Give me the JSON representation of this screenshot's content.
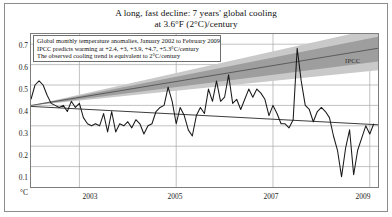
{
  "figure": {
    "title_line_1": "A long, fast decline: 7 years' global cooling",
    "title_line_2": "at 3.6°F (2°C)/century"
  },
  "legend": {
    "line_1": "Global monthly temperature anomalies, January 2002 to February 2009",
    "line_2": "IPCC predicts warming at +2.4, +3, +3.9, +4.7, +5.3°C/century",
    "line_3": "The observed cooling trend is equivalent to 2°C/century"
  },
  "annotations": {
    "ipcc": "IPCC"
  },
  "axis": {
    "y_unit": "°C",
    "y_ticks": [
      "0.7",
      "0.6",
      "0.5",
      "0.4",
      "0.3",
      "0.2",
      "0.1"
    ],
    "x_ticks": [
      "2003",
      "2005",
      "2007",
      "2009"
    ]
  },
  "colors": {
    "frame": "#8c8c8c",
    "plot_border": "#7d7d7d",
    "gridline": "#a8a8a8",
    "data_line": "#1a1a1a",
    "trend_line": "#3c3c3c",
    "ipcc_band_outer": "#c9c9c9",
    "ipcc_band_inner": "#9e9e9e",
    "ipcc_center_line": "#4a4a4a",
    "background": "#ffffff"
  },
  "chart_data": {
    "type": "line",
    "title": "A long, fast decline: 7 years' global cooling at 3.6°F (2°C)/century",
    "xlabel": "",
    "ylabel": "°C",
    "xlim": [
      2002.0,
      2009.17
    ],
    "ylim": [
      0.0,
      0.75
    ],
    "grid": true,
    "legend_position": "top-left-inside",
    "x_tick_values": [
      2003,
      2005,
      2007,
      2009
    ],
    "y_tick_values": [
      0.1,
      0.2,
      0.3,
      0.4,
      0.5,
      0.6,
      0.7
    ],
    "series": [
      {
        "name": "Global monthly temperature anomalies, January 2002 to February 2009",
        "type": "line",
        "color": "#1a1a1a",
        "x": [
          2002.0,
          2002.083,
          2002.167,
          2002.25,
          2002.333,
          2002.417,
          2002.5,
          2002.583,
          2002.667,
          2002.75,
          2002.833,
          2002.917,
          2003.0,
          2003.083,
          2003.167,
          2003.25,
          2003.333,
          2003.417,
          2003.5,
          2003.583,
          2003.667,
          2003.75,
          2003.833,
          2003.917,
          2004.0,
          2004.083,
          2004.167,
          2004.25,
          2004.333,
          2004.417,
          2004.5,
          2004.583,
          2004.667,
          2004.75,
          2004.833,
          2004.917,
          2005.0,
          2005.083,
          2005.167,
          2005.25,
          2005.333,
          2005.417,
          2005.5,
          2005.583,
          2005.667,
          2005.75,
          2005.833,
          2005.917,
          2006.0,
          2006.083,
          2006.167,
          2006.25,
          2006.333,
          2006.417,
          2006.5,
          2006.583,
          2006.667,
          2006.75,
          2006.833,
          2006.917,
          2007.0,
          2007.083,
          2007.167,
          2007.25,
          2007.333,
          2007.417,
          2007.5,
          2007.583,
          2007.667,
          2007.75,
          2007.833,
          2007.917,
          2008.0,
          2008.083,
          2008.167,
          2008.25,
          2008.333,
          2008.417,
          2008.5,
          2008.583,
          2008.667,
          2008.75,
          2008.833,
          2008.917,
          2009.0,
          2009.083
        ],
        "y": [
          0.43,
          0.5,
          0.52,
          0.5,
          0.45,
          0.41,
          0.4,
          0.39,
          0.4,
          0.37,
          0.42,
          0.39,
          0.41,
          0.34,
          0.31,
          0.3,
          0.31,
          0.3,
          0.36,
          0.27,
          0.37,
          0.27,
          0.31,
          0.3,
          0.32,
          0.29,
          0.33,
          0.31,
          0.26,
          0.3,
          0.31,
          0.37,
          0.39,
          0.4,
          0.49,
          0.42,
          0.31,
          0.39,
          0.35,
          0.28,
          0.25,
          0.35,
          0.39,
          0.36,
          0.48,
          0.42,
          0.52,
          0.42,
          0.44,
          0.55,
          0.41,
          0.43,
          0.38,
          0.43,
          0.48,
          0.44,
          0.48,
          0.46,
          0.43,
          0.35,
          0.4,
          0.36,
          0.31,
          0.31,
          0.29,
          0.33,
          0.68,
          0.52,
          0.4,
          0.38,
          0.32,
          0.37,
          0.39,
          0.37,
          0.34,
          0.25,
          0.18,
          0.05,
          0.19,
          0.28,
          0.06,
          0.18,
          0.24,
          0.3,
          0.26,
          0.31
        ]
      },
      {
        "name": "Observed cooling trend (2°C/century decline)",
        "type": "trend",
        "color": "#3c3c3c",
        "x": [
          2002.0,
          2009.17
        ],
        "y": [
          0.395,
          0.305
        ]
      },
      {
        "name": "IPCC predicted warming +2.4°C/century (lower bound)",
        "type": "projection",
        "color": "#c9c9c9",
        "x": [
          2002.0,
          2009.17
        ],
        "y": [
          0.4,
          0.572
        ]
      },
      {
        "name": "IPCC predicted warming +3°C/century",
        "type": "projection",
        "color": "#9e9e9e",
        "x": [
          2002.0,
          2009.17
        ],
        "y": [
          0.4,
          0.615
        ]
      },
      {
        "name": "IPCC predicted warming +3.9°C/century (central estimate)",
        "type": "projection-center",
        "color": "#4a4a4a",
        "x": [
          2002.0,
          2009.17
        ],
        "y": [
          0.4,
          0.68
        ]
      },
      {
        "name": "IPCC predicted warming +4.7°C/century",
        "type": "projection",
        "color": "#9e9e9e",
        "x": [
          2002.0,
          2009.17
        ],
        "y": [
          0.4,
          0.737
        ]
      },
      {
        "name": "IPCC predicted warming +5.3°C/century (upper bound)",
        "type": "projection",
        "color": "#c9c9c9",
        "x": [
          2002.0,
          2009.17
        ],
        "y": [
          0.4,
          0.78
        ]
      }
    ]
  }
}
